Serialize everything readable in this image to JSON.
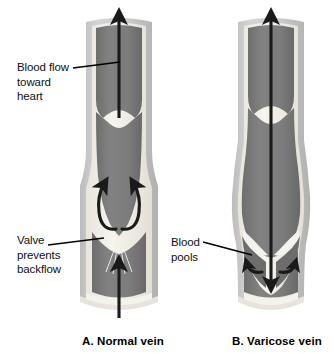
{
  "figure": {
    "background": "#ffffff",
    "width": 334,
    "height": 354
  },
  "colors": {
    "outer_wall": "#c9c9c9",
    "wall_shadow": "#b4b4b4",
    "inner_lining": "#f2f0ea",
    "blood": "#7b7b7b",
    "blood_dark": "#6a6a6a",
    "arrow": "#1a1a1a",
    "leader": "#000000",
    "text": "#101010",
    "background": "#ffffff"
  },
  "labels": {
    "blood_flow": "Blood flow\ntoward\nheart",
    "valve": "Valve\nprevents\nbackflow",
    "blood_pools": "Blood\npools"
  },
  "captions": {
    "panel_a": "A.  Normal vein",
    "panel_b": "B.  Varicose vein"
  },
  "panels": [
    {
      "id": "normal-vein",
      "caption": "A.  Normal vein",
      "valve_state": "closed",
      "cusps_meet": true,
      "flow_direction": "upward toward heart",
      "arrows": [
        "upward-main-arrow",
        "upward-lower-arrow",
        "recirculation-arrow-left",
        "recirculation-arrow-right"
      ],
      "annotations": [
        "blood_flow",
        "valve"
      ]
    },
    {
      "id": "varicose-vein",
      "caption": "B.  Varicose vein",
      "valve_state": "open / incompetent",
      "cusps_meet": false,
      "flow_direction": "downward backflow through gap",
      "vessel_shape": "dilated bulging wall",
      "arrows": [
        "downward-backflow-arrow",
        "pooling-arrow-left",
        "pooling-arrow-right"
      ],
      "annotations": [
        "blood_pools"
      ]
    }
  ]
}
